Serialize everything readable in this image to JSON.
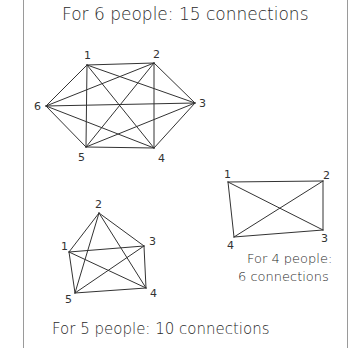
{
  "captions": {
    "six": "For 6 people:  15 connections",
    "four_line1": "For 4 people:",
    "four_line2": "6 connections",
    "five": "For 5 people:  10 connections"
  },
  "graphs": {
    "hexagon": {
      "people": 6,
      "connections": 15,
      "vertices": [
        {
          "label": "1",
          "x": 87,
          "y": 65
        },
        {
          "label": "2",
          "x": 154,
          "y": 63
        },
        {
          "label": "3",
          "x": 195,
          "y": 103
        },
        {
          "label": "4",
          "x": 154,
          "y": 148
        },
        {
          "label": "5",
          "x": 86,
          "y": 147
        },
        {
          "label": "6",
          "x": 46,
          "y": 106
        }
      ]
    },
    "rectangle": {
      "people": 4,
      "connections": 6,
      "vertices": [
        {
          "label": "1",
          "x": 228,
          "y": 182
        },
        {
          "label": "2",
          "x": 323,
          "y": 181
        },
        {
          "label": "3",
          "x": 323,
          "y": 230
        },
        {
          "label": "4",
          "x": 234,
          "y": 237
        }
      ]
    },
    "pentagon": {
      "people": 5,
      "connections": 10,
      "vertices": [
        {
          "label": "1",
          "x": 69,
          "y": 252
        },
        {
          "label": "2",
          "x": 99,
          "y": 213
        },
        {
          "label": "3",
          "x": 144,
          "y": 246
        },
        {
          "label": "4",
          "x": 146,
          "y": 288
        },
        {
          "label": "5",
          "x": 75,
          "y": 293
        }
      ]
    }
  }
}
